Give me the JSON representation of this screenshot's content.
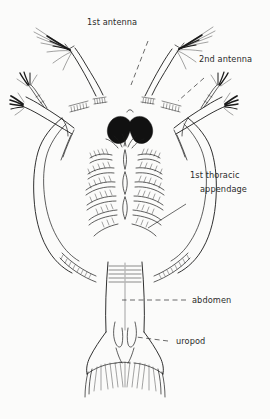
{
  "figure": {
    "background_color": "#fbfbfa",
    "ink_color": "#1a1a1a",
    "text_color": "#2b2b2b"
  },
  "labels": {
    "first_antenna": "1st antenna",
    "second_antenna": "2nd antenna",
    "first_thoracic_line1": "1st thoracic",
    "first_thoracic_line2": "appendage",
    "abdomen": "abdomen",
    "uropod": "uropod"
  }
}
